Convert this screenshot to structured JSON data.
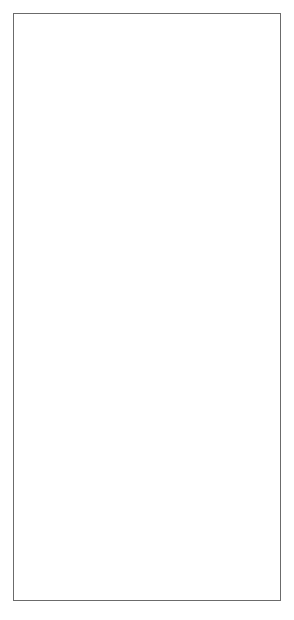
{
  "figure": {
    "background": "#ffffff",
    "foreground": "#1a1a1a",
    "frame_color": "#6b6b6b"
  },
  "panels": [
    {
      "id": "panel-top",
      "annotation_lines": [
        "5 WLM/m for 10 years",
        "- Model B"
      ],
      "xlabel": "Age",
      "ylabel": "Probability of tumour",
      "xticks": [
        "0",
        "20",
        "40",
        "60",
        "80"
      ],
      "yticks": [
        "0.0",
        "0.010",
        "0.020"
      ],
      "legend": [
        {
          "label": "no exposure",
          "style": "solid"
        },
        {
          "label": "t0=20",
          "style": "dotted"
        },
        {
          "label": "t0=40",
          "style": "dashed"
        },
        {
          "label": "t0=60",
          "style": "longdash"
        }
      ]
    },
    {
      "id": "panel-middle",
      "annotation_lines": [
        "5 WLM/m for 10 years - Model B"
      ],
      "xlabel": "Age at first exposure",
      "ylabel": "Probability of tumour at age 70",
      "xticks": [
        "20",
        "30",
        "40",
        "50",
        "60"
      ],
      "yticks": [
        "0.014",
        "0.018",
        "0.022",
        "0.026"
      ]
    },
    {
      "id": "panel-bottom",
      "annotation_lines": [
        "5 WLM/m for 10 years - Model B"
      ],
      "xlabel": "Age at first exposure",
      "ylabel": "Hazard at age 70",
      "xticks": [
        "20",
        "30",
        "40",
        "50",
        "60"
      ],
      "yticks": [
        "0.0020",
        "0.0022",
        "0.0024"
      ]
    }
  ],
  "chart_data": [
    {
      "type": "line",
      "id": "panel-top",
      "title": "",
      "xlabel": "Age",
      "ylabel": "Probability of tumour",
      "xlim": [
        0,
        82
      ],
      "ylim": [
        0,
        0.0215
      ],
      "xticks": [
        0,
        20,
        40,
        60,
        80
      ],
      "yticks": [
        0,
        0.01,
        0.02
      ],
      "ytick_labels": [
        "0.0",
        "0.010",
        "0.020"
      ],
      "grid": false,
      "legend_position": "top-left",
      "annotation": "5 WLM/m for 10 years - Model B",
      "x": [
        0,
        5,
        10,
        15,
        20,
        25,
        30,
        35,
        40,
        45,
        50,
        55,
        60,
        62,
        64,
        66,
        68,
        70,
        72,
        74,
        76,
        78,
        80
      ],
      "series": [
        {
          "name": "no exposure",
          "style": "solid",
          "values": [
            0,
            2e-05,
            5e-05,
            9e-05,
            0.00016,
            0.00027,
            0.00045,
            0.00072,
            0.00113,
            0.00175,
            0.00268,
            0.00405,
            0.00608,
            0.00718,
            0.00846,
            0.00995,
            0.01168,
            0.01368,
            0.0147,
            0.0158,
            0.0168,
            0.0176,
            0.018
          ]
        },
        {
          "name": "t0=20",
          "style": "dotted",
          "values": [
            0,
            3e-05,
            8e-05,
            0.00015,
            0.00028,
            0.00055,
            0.001,
            0.00168,
            0.00272,
            0.0043,
            0.00672,
            0.0104,
            0.016,
            0.0176,
            0.019,
            0.0201,
            0.0209,
            null,
            null,
            null,
            null,
            null,
            null
          ]
        },
        {
          "name": "t0=40",
          "style": "dashed",
          "values": [
            null,
            null,
            null,
            null,
            null,
            null,
            null,
            null,
            0.00113,
            0.003,
            0.0057,
            0.0096,
            0.0154,
            0.0172,
            0.0188,
            0.02,
            0.0208,
            null,
            null,
            null,
            null,
            null,
            null
          ]
        },
        {
          "name": "t0=60",
          "style": "longdash",
          "values": [
            null,
            null,
            null,
            null,
            null,
            null,
            null,
            null,
            null,
            null,
            null,
            null,
            0.00608,
            0.0079,
            0.0103,
            0.0132,
            0.0164,
            0.019,
            0.0206,
            0.021,
            null,
            null,
            null
          ]
        }
      ]
    },
    {
      "type": "line",
      "id": "panel-middle",
      "title": "",
      "xlabel": "Age at first exposure",
      "ylabel": "Probability of tumour at age 70",
      "xlim": [
        19,
        61
      ],
      "ylim": [
        0.0131,
        0.0262
      ],
      "xticks": [
        20,
        30,
        40,
        50,
        60
      ],
      "yticks": [
        0.014,
        0.018,
        0.022,
        0.026
      ],
      "grid": false,
      "annotation": "5 WLM/m for 10 years - Model B",
      "x": [
        20,
        22,
        24,
        26,
        28,
        30,
        32,
        34,
        36,
        38,
        40,
        42,
        44,
        46,
        48,
        50,
        52,
        54,
        56,
        58,
        60
      ],
      "series": [
        {
          "name": "probability at age 70",
          "style": "solid",
          "values": [
            0.02575,
            0.0258,
            0.0258,
            0.02576,
            0.02566,
            0.0255,
            0.02527,
            0.02496,
            0.02458,
            0.02412,
            0.02358,
            0.02294,
            0.0222,
            0.02134,
            0.02036,
            0.01924,
            0.01796,
            0.0165,
            0.0148,
            0.0129,
            0.01345
          ]
        }
      ]
    },
    {
      "type": "line",
      "id": "panel-bottom",
      "title": "",
      "xlabel": "Age at first exposure",
      "ylabel": "Hazard at age 70",
      "xlim": [
        19,
        61
      ],
      "ylim": [
        0.001955,
        0.002435
      ],
      "xticks": [
        20,
        30,
        40,
        50,
        60
      ],
      "yticks": [
        0.002,
        0.0022,
        0.0024
      ],
      "grid": false,
      "annotation": "5 WLM/m for 10 years - Model B",
      "x": [
        20,
        22,
        24,
        26,
        28,
        30,
        32,
        34,
        36,
        38,
        40,
        42,
        44,
        46,
        48,
        50,
        52,
        54,
        56,
        58,
        60
      ],
      "series": [
        {
          "name": "hazard at age 70",
          "style": "solid",
          "values": [
            0.00197,
            0.002,
            0.002022,
            0.00204,
            0.002056,
            0.00207,
            0.002083,
            0.002096,
            0.002108,
            0.002121,
            0.002134,
            0.002148,
            0.002163,
            0.00218,
            0.0022,
            0.002224,
            0.002252,
            0.002285,
            0.002322,
            0.002362,
            0.002392
          ]
        }
      ]
    }
  ]
}
